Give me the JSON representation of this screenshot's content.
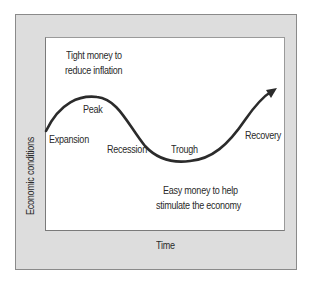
{
  "diagram": {
    "axes": {
      "x_label": "Time",
      "y_label": "Economic conditions"
    },
    "phases": [
      "Expansion",
      "Peak",
      "Recession",
      "Trough",
      "Recovery"
    ],
    "annotations": {
      "top": [
        "Tight money to",
        "reduce inflation"
      ],
      "bottom": [
        "Easy money to help",
        "stimulate the economy"
      ]
    },
    "colors": {
      "frame": "#dddddd",
      "frame_border": "#8a8a8a",
      "panel": "#ffffff",
      "curve": "#2b2b2b",
      "text": "#2a2a2a"
    }
  }
}
